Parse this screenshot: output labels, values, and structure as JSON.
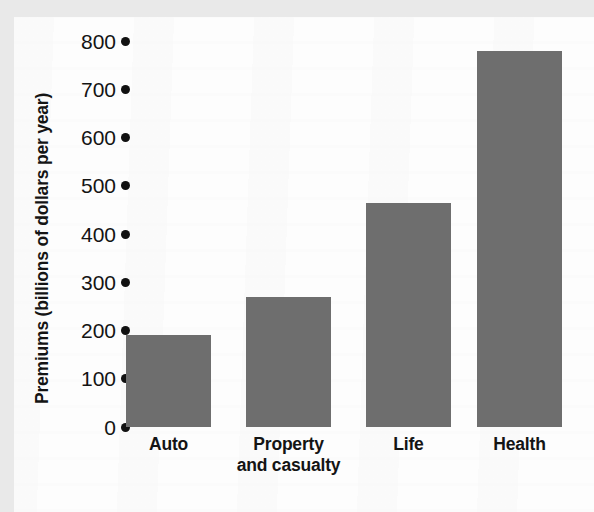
{
  "chart_data": {
    "type": "bar",
    "title": "",
    "xlabel": "",
    "ylabel": "Premiums (billions of dollars per year)",
    "categories": [
      "Auto",
      "Property and casualty",
      "Life",
      "Health"
    ],
    "values": [
      190,
      270,
      465,
      780
    ],
    "ylim": [
      0,
      800
    ],
    "yticks": [
      0,
      100,
      200,
      300,
      400,
      500,
      600,
      700,
      800
    ],
    "ytick_labels": [
      "0",
      "100",
      "200",
      "300",
      "400",
      "500",
      "600",
      "700",
      "800"
    ],
    "grid": false,
    "legend": null,
    "tick_marker": "dot",
    "bar_color": "#6e6e6e",
    "text_color": "#141414",
    "series": [
      {
        "name": "Premiums",
        "values": [
          190,
          270,
          465,
          780
        ]
      }
    ],
    "bars": [
      {
        "category": "Auto",
        "label_lines": [
          "Auto"
        ],
        "value": 190
      },
      {
        "category": "Property and casualty",
        "label_lines": [
          "Property",
          "and casualty"
        ],
        "value": 270
      },
      {
        "category": "Life",
        "label_lines": [
          "Life"
        ],
        "value": 465
      },
      {
        "category": "Health",
        "label_lines": [
          "Health"
        ],
        "value": 780
      }
    ]
  }
}
